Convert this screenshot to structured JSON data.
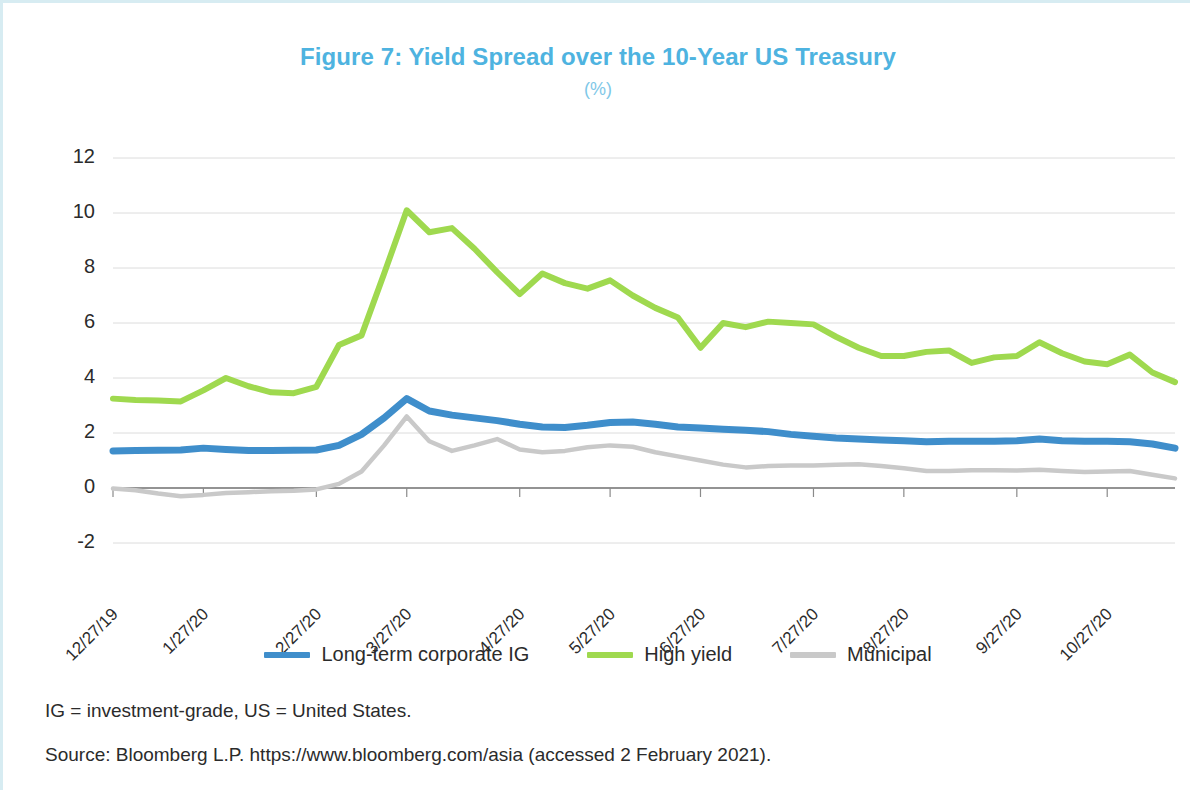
{
  "title": "Figure 7: Yield Spread over the 10-Year US Treasury",
  "subtitle": "(%)",
  "notes": {
    "abbreviations": "IG = investment-grade, US = United States.",
    "source": "Source: Bloomberg L.P. https://www.bloomberg.com/asia (accessed 2 February 2021)."
  },
  "colors": {
    "title": "#4eb3e0",
    "subtitle": "#7fc8e8",
    "corporate_ig": "#3f8ecb",
    "high_yield": "#9fd94f",
    "municipal": "#c9c9c9",
    "gridline": "#dcdcdc",
    "axis": "#6f6f6f",
    "page_border": "#d7ecf2"
  },
  "chart_data": {
    "type": "line",
    "title": "Figure 7: Yield Spread over the 10-Year US Treasury",
    "subtitle": "(%)",
    "xlabel": "",
    "ylabel": "",
    "ylim": [
      -2,
      12
    ],
    "yticks": [
      12,
      10,
      8,
      6,
      4,
      2,
      0,
      -2
    ],
    "ytick_labels": [
      "12",
      "10",
      "8",
      "6",
      "4",
      "2",
      "0",
      "-2"
    ],
    "grid": true,
    "legend_position": "bottom",
    "xtick_labels": [
      "12/27/19",
      "1/27/20",
      "2/27/20",
      "3/27/20",
      "4/27/20",
      "5/27/20",
      "6/27/20",
      "7/27/20",
      "8/27/20",
      "9/27/20",
      "10/27/20"
    ],
    "xtick_indices": [
      0,
      4,
      9,
      13,
      18,
      22,
      26,
      31,
      35,
      40,
      44
    ],
    "n_points": 48,
    "series": [
      {
        "name": "Long-term corporate IG",
        "color": "#3f8ecb",
        "values": [
          1.35,
          1.36,
          1.37,
          1.38,
          1.45,
          1.4,
          1.36,
          1.36,
          1.37,
          1.38,
          1.55,
          1.95,
          2.55,
          3.25,
          2.8,
          2.65,
          2.55,
          2.45,
          2.32,
          2.22,
          2.2,
          2.28,
          2.38,
          2.4,
          2.32,
          2.22,
          2.18,
          2.14,
          2.1,
          2.05,
          1.95,
          1.88,
          1.82,
          1.78,
          1.75,
          1.72,
          1.68,
          1.7,
          1.7,
          1.7,
          1.72,
          1.78,
          1.72,
          1.7,
          1.7,
          1.68,
          1.6,
          1.45
        ]
      },
      {
        "name": "High yield",
        "color": "#9fd94f",
        "values": [
          3.25,
          3.2,
          3.18,
          3.15,
          3.55,
          4.0,
          3.7,
          3.48,
          3.45,
          3.68,
          5.2,
          5.55,
          7.8,
          10.1,
          9.3,
          9.45,
          8.7,
          7.85,
          7.05,
          7.8,
          7.45,
          7.25,
          7.55,
          7.0,
          6.55,
          6.2,
          5.1,
          6.0,
          5.85,
          6.05,
          6.0,
          5.95,
          5.5,
          5.1,
          4.8,
          4.8,
          4.95,
          5.0,
          4.55,
          4.75,
          4.8,
          5.3,
          4.9,
          4.6,
          4.5,
          4.85,
          4.2,
          3.85
        ]
      },
      {
        "name": "Municipal",
        "color": "#c9c9c9",
        "values": [
          -0.02,
          -0.08,
          -0.2,
          -0.3,
          -0.25,
          -0.18,
          -0.15,
          -0.12,
          -0.1,
          -0.05,
          0.15,
          0.6,
          1.55,
          2.6,
          1.7,
          1.35,
          1.55,
          1.78,
          1.4,
          1.3,
          1.35,
          1.48,
          1.55,
          1.5,
          1.3,
          1.15,
          1.0,
          0.85,
          0.75,
          0.8,
          0.82,
          0.82,
          0.85,
          0.86,
          0.8,
          0.72,
          0.62,
          0.62,
          0.65,
          0.65,
          0.64,
          0.66,
          0.62,
          0.58,
          0.6,
          0.62,
          0.48,
          0.35
        ]
      }
    ]
  },
  "legend": [
    {
      "label": "Long-term corporate IG",
      "color": "#3f8ecb"
    },
    {
      "label": "High yield",
      "color": "#9fd94f"
    },
    {
      "label": "Municipal",
      "color": "#c9c9c9"
    }
  ]
}
